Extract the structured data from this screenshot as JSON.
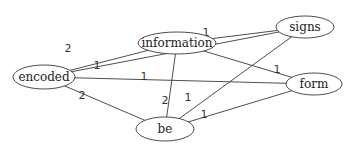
{
  "diagram": {
    "type": "weighted-undirected-graph",
    "nodes": [
      {
        "id": "information",
        "label": "information",
        "cx": 177,
        "cy": 14,
        "rx": 39,
        "ry": 11
      },
      {
        "id": "signs",
        "label": "signs",
        "cx": 305,
        "cy": 27,
        "rx": 29,
        "ry": 11
      },
      {
        "id": "encoded",
        "label": "encoded",
        "cx": 44,
        "cy": 77,
        "rx": 31,
        "ry": 12
      },
      {
        "id": "form",
        "label": "form",
        "cx": 314,
        "cy": 84,
        "rx": 28,
        "ry": 11
      },
      {
        "id": "be",
        "label": "be",
        "cx": 165,
        "cy": 129,
        "rx": 29,
        "ry": 12
      }
    ],
    "edges": [
      {
        "source": "encoded",
        "target": "information",
        "weight": "2",
        "lx": 68,
        "ly": 52
      },
      {
        "source": "encoded",
        "target": "signs",
        "weight": "1",
        "lx": 97,
        "ly": 69
      },
      {
        "source": "encoded",
        "target": "form",
        "weight": "1",
        "lx": 144,
        "ly": 80
      },
      {
        "source": "encoded",
        "target": "be",
        "weight": "2",
        "lx": 82,
        "ly": 99
      },
      {
        "source": "information",
        "target": "signs",
        "weight": "1",
        "lx": 206,
        "ly": 36
      },
      {
        "source": "information",
        "target": "form",
        "weight": "1",
        "lx": 277,
        "ly": 73
      },
      {
        "source": "information",
        "target": "be",
        "weight": "2",
        "lx": 165,
        "ly": 104
      },
      {
        "source": "signs",
        "target": "be",
        "weight": "1",
        "lx": 188,
        "ly": 101
      },
      {
        "source": "be",
        "target": "form",
        "weight": "1",
        "lx": 204,
        "ly": 118
      }
    ]
  }
}
